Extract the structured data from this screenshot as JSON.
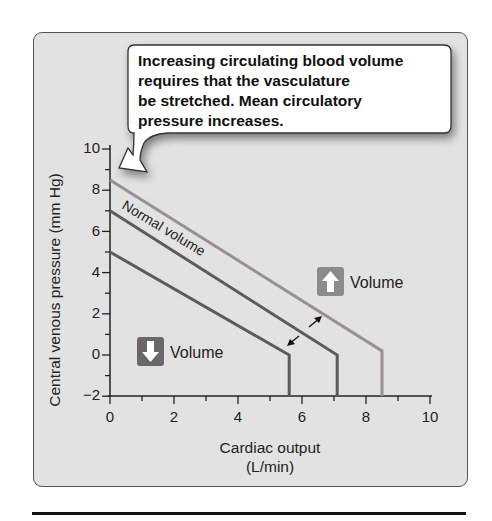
{
  "chart_data": {
    "type": "line",
    "title": "",
    "xlabel": "Cardiac output (L/min)",
    "xlabel_lines": [
      "Cardiac output",
      "(L/min)"
    ],
    "ylabel": "Central venous pressure  (mm Hg)",
    "xlim": [
      0,
      10
    ],
    "ylim": [
      -2,
      10
    ],
    "x_ticks": [
      "0",
      "2",
      "4",
      "6",
      "8",
      "10"
    ],
    "y_ticks": [
      "10",
      "8",
      "6",
      "4",
      "2",
      "0",
      "−2"
    ],
    "grid": false,
    "series": [
      {
        "name": "Increased volume",
        "color": "#9a8f96",
        "points": [
          [
            0,
            8.5
          ],
          [
            8.5,
            0.2
          ],
          [
            8.5,
            -2
          ]
        ]
      },
      {
        "name": "Normal volume",
        "color": "#5f5a5e",
        "points": [
          [
            0,
            7
          ],
          [
            7.1,
            0
          ],
          [
            7.1,
            -2
          ]
        ]
      },
      {
        "name": "Decreased volume",
        "color": "#5f5a5e",
        "points": [
          [
            0,
            5
          ],
          [
            5.6,
            0
          ],
          [
            5.6,
            -2
          ]
        ]
      }
    ],
    "annotations": [
      {
        "text": "Normal volume",
        "type": "curve-label"
      },
      {
        "text": "Volume",
        "icon": "up-arrow",
        "meaning": "increased volume"
      },
      {
        "text": "Volume",
        "icon": "down-arrow",
        "meaning": "decreased volume"
      }
    ],
    "callout": {
      "lines": [
        "Increasing circulating blood volume",
        "requires that the vasculature",
        "be stretched. Mean circulatory",
        "pressure increases."
      ]
    }
  },
  "labels": {
    "normal_volume": "Normal volume",
    "up_volume": "Volume",
    "down_volume": "Volume"
  },
  "colors": {
    "panel_bg": "#e3e2e2",
    "up_box": "#8d8a8c",
    "down_box": "#6b6669",
    "line_light": "#9a8f96",
    "line_dark": "#5f5a5e"
  }
}
